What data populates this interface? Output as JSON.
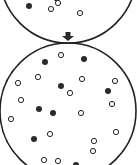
{
  "diagram": {
    "colors": {
      "stroke": "#222222",
      "filled": "#2a2a2a",
      "open_fill": "#ffffff",
      "background": "#ffffff"
    },
    "top_circle": {
      "cx": 68,
      "cy": -25,
      "r": 68,
      "filled_dots": [
        [
          29,
          6
        ]
      ],
      "open_dots": [
        [
          51,
          9
        ],
        [
          58,
          3
        ],
        [
          80,
          13
        ],
        [
          56,
          -2
        ]
      ]
    },
    "arrow": {
      "x": 68,
      "y_top": 32,
      "y_bottom": 41
    },
    "bottom_circle": {
      "cx": 68,
      "cy": 111,
      "r": 68,
      "filled_dots": [
        [
          45,
          62
        ],
        [
          84,
          59
        ],
        [
          61,
          86
        ],
        [
          108,
          91
        ],
        [
          39,
          109
        ],
        [
          53,
          113
        ],
        [
          34,
          139
        ],
        [
          76,
          165
        ]
      ],
      "open_dots": [
        [
          61,
          55
        ],
        [
          38,
          77
        ],
        [
          18,
          83
        ],
        [
          82,
          79
        ],
        [
          115,
          81
        ],
        [
          70,
          93
        ],
        [
          21,
          100
        ],
        [
          112,
          104
        ],
        [
          81,
          113
        ],
        [
          11,
          119
        ],
        [
          50,
          134
        ],
        [
          116,
          132
        ],
        [
          94,
          141
        ],
        [
          93,
          151
        ],
        [
          44,
          160
        ],
        [
          58,
          161
        ]
      ]
    }
  }
}
